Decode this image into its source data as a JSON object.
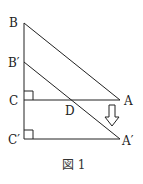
{
  "figure": {
    "caption": "図 1",
    "points": {
      "B": "B",
      "B_prime": "B′",
      "C": "C",
      "C_prime": "C′",
      "A": "A",
      "A_prime": "A′",
      "D": "D"
    },
    "arrow": "down-arrow"
  }
}
